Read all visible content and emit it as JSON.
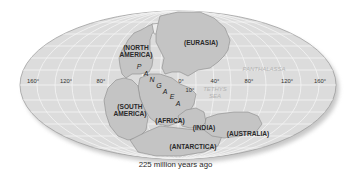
{
  "map": {
    "title": "Pangaea supercontinent",
    "caption": "225 million years ago",
    "colors": {
      "ocean": "#dcdcdc",
      "land": "#c4c4c4",
      "land_stroke": "#8a8a8a",
      "grid": "#f4f4f4",
      "rim": "#a0a0a0"
    },
    "supercontinent": {
      "name": "PANGAEA",
      "letters": [
        "P",
        "A",
        "N",
        "G",
        "A",
        "E",
        "A"
      ]
    },
    "continents": [
      {
        "label": "(NORTH",
        "label2": "AMERICA)"
      },
      {
        "label": "(EURASIA)"
      },
      {
        "label": "(SOUTH",
        "label2": "AMERICA)"
      },
      {
        "label": "(AFRICA)"
      },
      {
        "label": "(INDIA)"
      },
      {
        "label": "(AUSTRALIA)"
      },
      {
        "label": "(ANTARCTICA)"
      }
    ],
    "oceans": [
      {
        "label": "PANTHALASSA"
      },
      {
        "label": "TETHYS",
        "label2": "SEA"
      }
    ],
    "longitude_labels": [
      "160°",
      "120°",
      "80°",
      "0°",
      "40°",
      "80°",
      "120°",
      "160°"
    ],
    "latitude_label": "10°"
  }
}
